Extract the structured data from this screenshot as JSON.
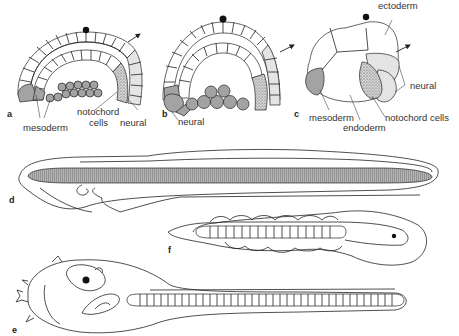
{
  "figure": {
    "panels": [
      {
        "id": "a",
        "label": "a",
        "description": "cross-section of early embryo (blastula stage, half-section)"
      },
      {
        "id": "b",
        "label": "b",
        "description": "embryo section, later stage"
      },
      {
        "id": "c",
        "label": "c",
        "description": "whole embryo external view"
      },
      {
        "id": "d",
        "label": "d",
        "description": "elongated larva with notochord"
      },
      {
        "id": "e",
        "label": "e",
        "description": "tadpole larva with segmented notochord"
      },
      {
        "id": "f",
        "label": "f",
        "description": "curled larva with segmented notochord"
      }
    ],
    "labels": {
      "a_mesoderm": "mesoderm",
      "a_notochord": "notochord",
      "a_cells": "cells",
      "a_neural": "neural",
      "b_neural": "neural",
      "c_ectoderm": "ectoderm",
      "c_neural": "neural",
      "c_mesoderm": "mesoderm",
      "c_endoderm": "endoderm",
      "c_notochord": "notochord cells"
    },
    "colors": {
      "mesoderm_fill": "#a3a3a3",
      "neural_fill": "#e4e4e4",
      "notochord_stipple": "#555555",
      "line": "#222222"
    }
  }
}
